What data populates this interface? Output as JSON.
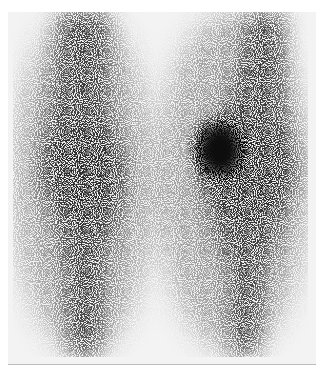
{
  "image": {
    "kind": "bone-scintigraphy",
    "view": "knees",
    "colors": {
      "background": "#ffffff",
      "field": "#f3f3f3",
      "tracer": "#1a1a1a"
    }
  }
}
